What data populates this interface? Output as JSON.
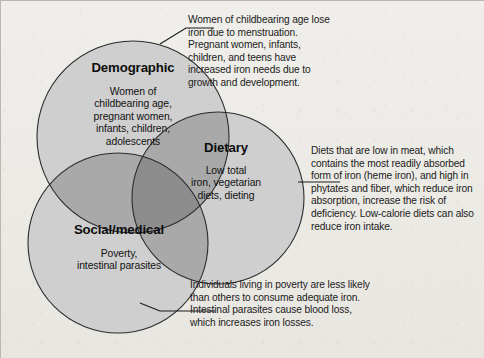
{
  "diagram": {
    "type": "venn-3-circle",
    "topic": "Risk factors for iron deficiency",
    "colors": {
      "background": "#eceae6",
      "circle_fill": "#cfcfcf",
      "overlap_two": "#a9a9a9",
      "overlap_three": "#8d8d8d",
      "outline": "#2b2b2b",
      "text": "#111111",
      "leader_line": "#1a1a1a"
    },
    "circles": [
      {
        "id": "demographic",
        "title": "Demographic",
        "body": "Women of\nchildbearing age,\npregnant women,\ninfants, children,\nadolescents",
        "cx": 133,
        "cy": 137,
        "r": 96
      },
      {
        "id": "dietary",
        "title": "Dietary",
        "body": "Low total\niron, vegetarian\ndiets, dieting",
        "cx": 218,
        "cy": 198,
        "r": 86
      },
      {
        "id": "social-medical",
        "title": "Social/medical",
        "body": "Poverty,\nintestinal parasites",
        "cx": 118,
        "cy": 243,
        "r": 90
      }
    ],
    "annotations": [
      {
        "id": "demographic-note",
        "target": "demographic",
        "text": "Women of childbearing age lose iron due to menstruation. Pregnant women, infants, children, and teens have increased iron needs due to growth and development."
      },
      {
        "id": "dietary-note",
        "target": "dietary",
        "text": "Diets that are low in meat, which contains the most readily absorbed form of iron (heme iron), and high in phytates and fiber, which reduce iron absorption, increase the risk of deficiency. Low-calorie diets can also reduce iron intake."
      },
      {
        "id": "social-medical-note",
        "target": "social-medical",
        "text": "Individuals living in poverty are less likely than others to consume adequate iron. Intestinal parasites cause blood loss, which increases iron losses."
      }
    ]
  }
}
